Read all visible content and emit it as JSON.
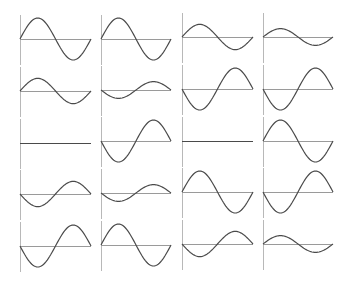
{
  "chart_data": {
    "type": "line",
    "title": "",
    "xlabel": "",
    "ylabel": "",
    "layout": {
      "rows": 5,
      "cols": 4,
      "grid": false,
      "legend": "none"
    },
    "style": {
      "wave_color": "#4a4a4a",
      "axis_color": "#9a9a9a",
      "vaxis_color": "#b8b8b8",
      "background": "#ffffff"
    },
    "x_range": [
      0,
      1
    ],
    "y_range": [
      -1,
      1
    ],
    "function": "amplitude * sin(2*pi*x)",
    "columns_px": [
      {
        "x0": 20,
        "x1": 91
      },
      {
        "x0": 101,
        "x1": 171
      },
      {
        "x0": 182,
        "x1": 253
      },
      {
        "x0": 263,
        "x1": 333
      }
    ],
    "rows_px": [
      {
        "baseline": [
          39,
          39,
          37,
          37
        ]
      },
      {
        "baseline": [
          91,
          90,
          89,
          89
        ]
      },
      {
        "baseline": [
          143,
          141,
          141,
          141
        ]
      },
      {
        "baseline": [
          194,
          193,
          192,
          192
        ]
      },
      {
        "baseline": [
          246,
          245,
          244,
          244
        ]
      }
    ],
    "unit_amplitude_px": 21,
    "series": [
      {
        "name": "r1c1",
        "row": 1,
        "col": 1,
        "amplitude": 1.0
      },
      {
        "name": "r1c2",
        "row": 1,
        "col": 2,
        "amplitude": 1.0
      },
      {
        "name": "r1c3",
        "row": 1,
        "col": 3,
        "amplitude": 0.6
      },
      {
        "name": "r1c4",
        "row": 1,
        "col": 4,
        "amplitude": 0.4
      },
      {
        "name": "r2c1",
        "row": 2,
        "col": 1,
        "amplitude": 0.6
      },
      {
        "name": "r2c2",
        "row": 2,
        "col": 2,
        "amplitude": -0.4
      },
      {
        "name": "r2c3",
        "row": 2,
        "col": 3,
        "amplitude": -1.0
      },
      {
        "name": "r2c4",
        "row": 2,
        "col": 4,
        "amplitude": -1.0
      },
      {
        "name": "r3c1",
        "row": 3,
        "col": 1,
        "amplitude": 0.0
      },
      {
        "name": "r3c2",
        "row": 3,
        "col": 2,
        "amplitude": -1.0
      },
      {
        "name": "r3c3",
        "row": 3,
        "col": 3,
        "amplitude": 0.0
      },
      {
        "name": "r3c4",
        "row": 3,
        "col": 4,
        "amplitude": 1.0
      },
      {
        "name": "r4c1",
        "row": 4,
        "col": 1,
        "amplitude": -0.6
      },
      {
        "name": "r4c2",
        "row": 4,
        "col": 2,
        "amplitude": -0.4
      },
      {
        "name": "r4c3",
        "row": 4,
        "col": 3,
        "amplitude": 1.0
      },
      {
        "name": "r4c4",
        "row": 4,
        "col": 4,
        "amplitude": -1.0
      },
      {
        "name": "r5c1",
        "row": 5,
        "col": 1,
        "amplitude": -1.0
      },
      {
        "name": "r5c2",
        "row": 5,
        "col": 2,
        "amplitude": 1.0
      },
      {
        "name": "r5c3",
        "row": 5,
        "col": 3,
        "amplitude": -0.6
      },
      {
        "name": "r5c4",
        "row": 5,
        "col": 4,
        "amplitude": 0.4
      }
    ]
  }
}
